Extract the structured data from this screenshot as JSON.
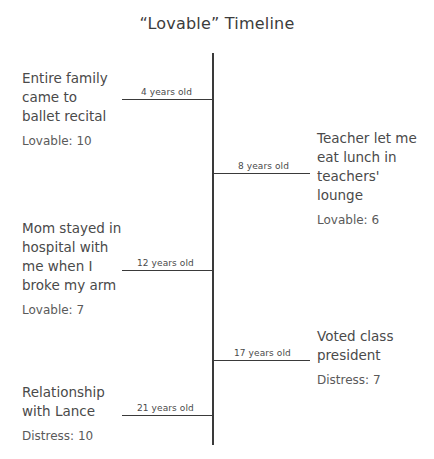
{
  "title": "“Lovable” Timeline",
  "axis": {
    "orientation": "vertical",
    "line_color": "#3a3a3a"
  },
  "events": [
    {
      "id": "ballet-recital",
      "side": "left",
      "age_label": "4 years old",
      "description": "Entire family\ncame to\nballet recital",
      "score": "Lovable: 10",
      "score_type": "Lovable",
      "score_value": "10"
    },
    {
      "id": "teachers-lounge",
      "side": "right",
      "age_label": "8 years old",
      "description": "Teacher let me\neat lunch in\nteachers'\nlounge",
      "score": "Lovable: 6",
      "score_type": "Lovable",
      "score_value": "6"
    },
    {
      "id": "broken-arm",
      "side": "left",
      "age_label": "12 years old",
      "description": "Mom stayed in\nhospital with\nme when I\nbroke my arm",
      "score": "Lovable: 7",
      "score_type": "Lovable",
      "score_value": "7"
    },
    {
      "id": "class-president",
      "side": "right",
      "age_label": "17 years old",
      "description": "Voted class\npresident",
      "score": "Distress: 7",
      "score_type": "Distress",
      "score_value": "7"
    },
    {
      "id": "relationship-lance",
      "side": "left",
      "age_label": "21 years old",
      "description": "Relationship\nwith Lance",
      "score": "Distress: 10",
      "score_type": "Distress",
      "score_value": "10"
    }
  ]
}
